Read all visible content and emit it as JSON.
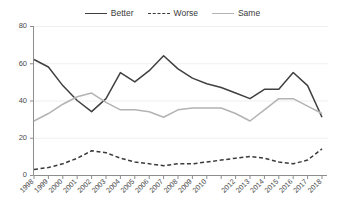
{
  "chart_data": {
    "type": "line",
    "title": "",
    "subtitle": "",
    "xlabel": "",
    "ylabel": "",
    "ylim": [
      0,
      80
    ],
    "yticks": [
      0,
      20,
      40,
      60,
      80
    ],
    "grid": true,
    "legend_position": "top-center",
    "categories": [
      "1998",
      "1999",
      "2000",
      "2001",
      "2002",
      "2003",
      "2004",
      "2005",
      "2006",
      "2007",
      "2008",
      "2009",
      "2010",
      "2011",
      "2012",
      "2013",
      "2014",
      "2015",
      "2016",
      "2017",
      "2018"
    ],
    "xtick_labels": [
      "1998",
      "1999",
      "2000",
      "2001",
      "2002",
      "2003",
      "2004",
      "2005",
      "2006",
      "2007",
      "2008",
      "2009",
      "2010",
      "",
      "2012",
      "2013",
      "2014",
      "2015",
      "2016",
      "2017",
      "2018"
    ],
    "series": [
      {
        "name": "Better",
        "color": "#404040",
        "dash": "none",
        "values": [
          62,
          58,
          48,
          40,
          34,
          41,
          55,
          50,
          56,
          64,
          57,
          52,
          49,
          47,
          44,
          41,
          46,
          46,
          55,
          48,
          31
        ]
      },
      {
        "name": "Worse",
        "color": "#3a3a3a",
        "dash": "dashed",
        "values": [
          3,
          4,
          6,
          9,
          13,
          12,
          9,
          7,
          6,
          5,
          6,
          6,
          7,
          8,
          9,
          10,
          9,
          7,
          6,
          8,
          14
        ]
      },
      {
        "name": "Same",
        "color": "#b3b3b3",
        "dash": "none",
        "values": [
          29,
          33,
          38,
          42,
          44,
          39,
          35,
          35,
          34,
          31,
          35,
          36,
          36,
          36,
          33,
          29,
          35,
          41,
          41,
          37,
          33
        ]
      }
    ]
  },
  "legend": {
    "items": [
      {
        "label": "Better"
      },
      {
        "label": "Worse"
      },
      {
        "label": "Same"
      }
    ]
  },
  "axes": {
    "y_tick_labels": [
      "0",
      "20",
      "40",
      "60",
      "80"
    ]
  }
}
